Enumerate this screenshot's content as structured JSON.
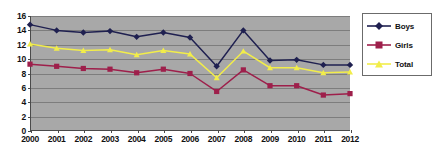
{
  "chart_data": {
    "type": "line",
    "title": "",
    "xlabel": "",
    "ylabel": "",
    "categories": [
      "2000",
      "2001",
      "2002",
      "2003",
      "2004",
      "2005",
      "2006",
      "2007",
      "2008",
      "2009",
      "2010",
      "2011",
      "2012"
    ],
    "ylim": [
      0,
      16
    ],
    "ytick_step": 2,
    "yticks": [
      "0",
      "2",
      "4",
      "6",
      "8",
      "10",
      "12",
      "14",
      "16"
    ],
    "grid": true,
    "legend_position": "right",
    "plot_background": "#a8a8a8",
    "gridline_color": "#7d7d7d",
    "series": [
      {
        "name": "Boys",
        "color": "#1f2050",
        "marker": "diamond",
        "values": [
          14.8,
          14.0,
          13.7,
          13.9,
          13.1,
          13.7,
          13.0,
          9.0,
          14.0,
          9.8,
          9.9,
          9.2,
          9.2
        ]
      },
      {
        "name": "Girls",
        "color": "#9e1f4b",
        "marker": "square",
        "values": [
          9.3,
          9.0,
          8.7,
          8.6,
          8.1,
          8.6,
          8.0,
          5.5,
          8.5,
          6.3,
          6.3,
          5.0,
          5.2
        ]
      },
      {
        "name": "Total",
        "color": "#f2ed4a",
        "marker": "triangle",
        "values": [
          12.1,
          11.5,
          11.2,
          11.3,
          10.6,
          11.2,
          10.7,
          7.4,
          11.1,
          8.8,
          8.8,
          8.1,
          8.2
        ]
      }
    ]
  },
  "legend": {
    "items": [
      {
        "label": "Boys"
      },
      {
        "label": "Girls"
      },
      {
        "label": "Total"
      }
    ]
  }
}
